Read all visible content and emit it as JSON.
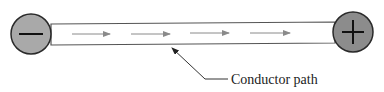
{
  "diagram": {
    "title": "",
    "terminals": [
      {
        "id": "negative",
        "symbol": "−",
        "fill": "#a9a9a9",
        "stroke": "#2a2a2a",
        "cx": 31,
        "cy": 34,
        "r": 20
      },
      {
        "id": "positive",
        "symbol": "+",
        "fill": "#8c8c8c",
        "stroke": "#2a2a2a",
        "cx": 353,
        "cy": 32,
        "r": 20
      }
    ],
    "conductor": {
      "fill": "#ffffff",
      "stroke": "#555555",
      "points": "51,24 335,22 335,43 51,45"
    },
    "flow_arrows": {
      "color": "#8a8a8a",
      "direction": "left-to-right",
      "items": [
        {
          "x1": 72,
          "y1": 34,
          "x2": 110,
          "y2": 34
        },
        {
          "x1": 131,
          "y1": 34,
          "x2": 170,
          "y2": 34
        },
        {
          "x1": 190,
          "y1": 33,
          "x2": 229,
          "y2": 33
        },
        {
          "x1": 250,
          "y1": 33,
          "x2": 290,
          "y2": 33
        }
      ]
    },
    "callout": {
      "label": "Conductor path",
      "leader_points": "228,79 205,79 172,48",
      "text_x": 231,
      "text_y": 84
    }
  }
}
